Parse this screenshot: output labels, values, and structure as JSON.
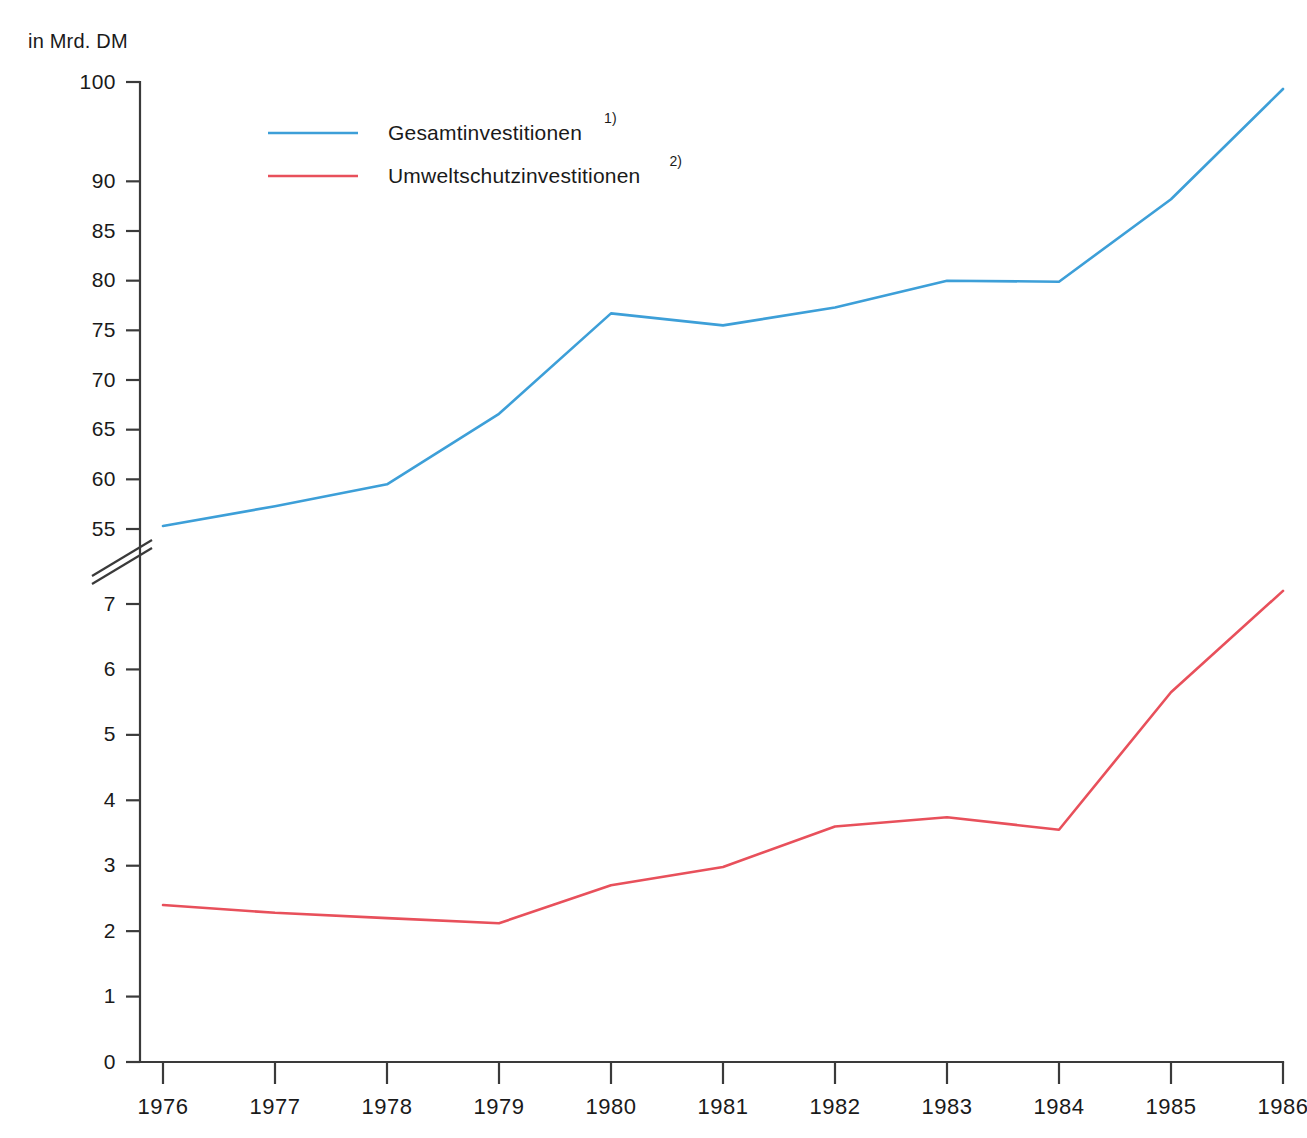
{
  "chart_data": {
    "type": "line",
    "title": "",
    "subtitle": "",
    "unit_label": "in Mrd. DM",
    "xlabel": "",
    "ylabel": "",
    "grid": false,
    "legend_position": "top-left-inside",
    "broken_axis": true,
    "axis_break_note": "Y-Achse unterbrochen zwischen 7 und 55",
    "x": [
      1976,
      1977,
      1978,
      1979,
      1980,
      1981,
      1982,
      1983,
      1984,
      1985,
      1986
    ],
    "categories": [
      "1976",
      "1977",
      "1978",
      "1979",
      "1980",
      "1981",
      "1982",
      "1983",
      "1984",
      "1985",
      "1986"
    ],
    "y_ticks_upper": [
      "55",
      "60",
      "65",
      "70",
      "75",
      "80",
      "85",
      "90",
      "100"
    ],
    "y_ticks_lower": [
      "0",
      "1",
      "2",
      "3",
      "4",
      "5",
      "6",
      "7"
    ],
    "ylim_upper": [
      55,
      100
    ],
    "ylim_lower": [
      0,
      7.5
    ],
    "series": [
      {
        "name": "Gesamtinvestitionen",
        "footnote": "1)",
        "color": "#3d9fd8",
        "scale": "upper",
        "values": [
          55.3,
          57.3,
          59.5,
          66.6,
          76.7,
          75.5,
          77.3,
          80.0,
          79.9,
          88.2,
          99.3
        ]
      },
      {
        "name": "Umweltschutzinvestitionen",
        "footnote": "2)",
        "color": "#e8505b",
        "scale": "lower",
        "values": [
          2.4,
          2.28,
          2.2,
          2.12,
          2.7,
          2.98,
          3.6,
          3.74,
          3.55,
          5.65,
          7.2
        ]
      }
    ]
  },
  "legend": {
    "items": [
      {
        "label": "Gesamtinvestitionen",
        "sup": "1)",
        "color": "#3d9fd8"
      },
      {
        "label": "Umweltschutzinvestitionen",
        "sup": "2)",
        "color": "#e8505b"
      }
    ]
  },
  "colors": {
    "series_blue": "#3d9fd8",
    "series_red": "#e8505b",
    "axis": "#3a3a3a",
    "text": "#1a1a1a",
    "background": "#ffffff"
  }
}
